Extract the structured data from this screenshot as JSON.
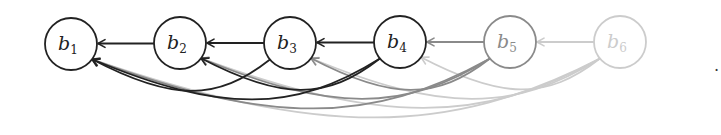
{
  "diagram": {
    "nodes": [
      {
        "id": "b1",
        "label": "b",
        "sub": "1",
        "x": 71,
        "y": 44,
        "color": "#222222"
      },
      {
        "id": "b2",
        "label": "b",
        "sub": "2",
        "x": 180,
        "y": 43,
        "color": "#222222"
      },
      {
        "id": "b3",
        "label": "b",
        "sub": "3",
        "x": 290,
        "y": 43,
        "color": "#222222"
      },
      {
        "id": "b4",
        "label": "b",
        "sub": "4",
        "x": 400,
        "y": 42,
        "color": "#222222"
      },
      {
        "id": "b5",
        "label": "b",
        "sub": "5",
        "x": 510,
        "y": 42,
        "color": "#8a8a8a"
      },
      {
        "id": "b6",
        "label": "b",
        "sub": "6",
        "x": 620,
        "y": 42,
        "color": "#cccccc"
      }
    ],
    "edges": [
      {
        "from": "b2",
        "to": "b1",
        "color": "#222222"
      },
      {
        "from": "b3",
        "to": "b2",
        "color": "#222222"
      },
      {
        "from": "b4",
        "to": "b3",
        "color": "#222222"
      },
      {
        "from": "b5",
        "to": "b4",
        "color": "#8a8a8a"
      },
      {
        "from": "b6",
        "to": "b5",
        "color": "#cccccc"
      },
      {
        "from": "b3",
        "to": "b1",
        "color": "#222222"
      },
      {
        "from": "b4",
        "to": "b2",
        "color": "#222222"
      },
      {
        "from": "b4",
        "to": "b1",
        "color": "#222222"
      },
      {
        "from": "b5",
        "to": "b3",
        "color": "#8a8a8a"
      },
      {
        "from": "b5",
        "to": "b2",
        "color": "#8a8a8a"
      },
      {
        "from": "b5",
        "to": "b1",
        "color": "#8a8a8a"
      },
      {
        "from": "b6",
        "to": "b4",
        "color": "#cccccc"
      },
      {
        "from": "b6",
        "to": "b3",
        "color": "#cccccc"
      },
      {
        "from": "b6",
        "to": "b2",
        "color": "#cccccc"
      },
      {
        "from": "b6",
        "to": "b1",
        "color": "#cccccc"
      }
    ],
    "radius": 26,
    "trailing_mark": "."
  }
}
